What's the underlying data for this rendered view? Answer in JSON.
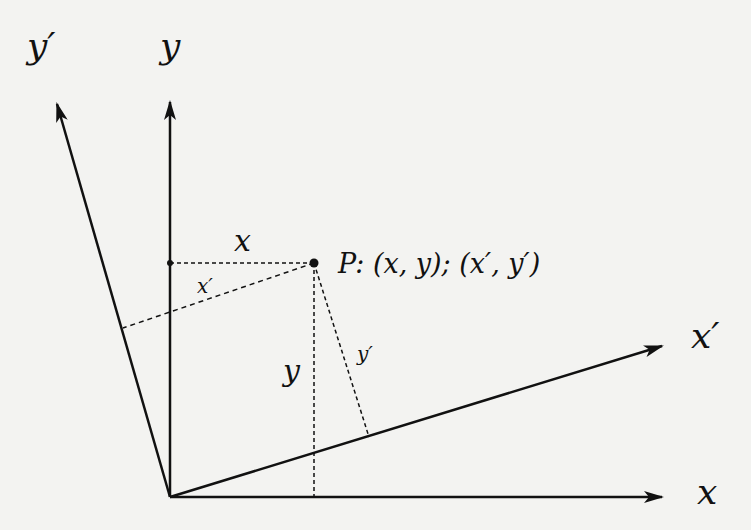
{
  "diagram": {
    "axes": {
      "x": {
        "label": "x"
      },
      "y": {
        "label": "y"
      },
      "x_prime": {
        "label": "x′"
      },
      "y_prime": {
        "label": "y′"
      }
    },
    "point": {
      "label": "P: (x, y); (x′, y′)"
    },
    "projection_labels": {
      "x": "x",
      "y": "y",
      "x_prime": "x′",
      "y_prime": "y′"
    },
    "colors": {
      "background": "#f3f3f1",
      "ink": "#111111"
    }
  }
}
